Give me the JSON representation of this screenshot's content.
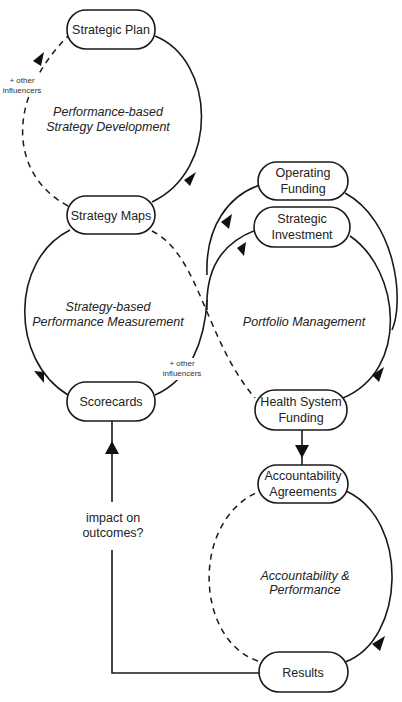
{
  "nodes": {
    "strategic_plan": [
      "Strategic Plan"
    ],
    "strategy_maps": [
      "Strategy Maps"
    ],
    "scorecards": [
      "Scorecards"
    ],
    "operating_funding": [
      "Operating",
      "Funding"
    ],
    "strategic_investment": [
      "Strategic",
      "Investment"
    ],
    "health_system_funding": [
      "Health System",
      "Funding"
    ],
    "accountability_agreements": [
      "Accountability",
      "Agreements"
    ],
    "results": [
      "Results"
    ]
  },
  "cycles": {
    "strategy_development": [
      "Performance-based",
      "Strategy Development"
    ],
    "performance_measurement": [
      "Strategy-based",
      "Performance Measurement"
    ],
    "portfolio_management": [
      "Portfolio Management"
    ],
    "accountability_performance": [
      "Accountability &",
      "Performance"
    ]
  },
  "annotations": {
    "other_influencers_top": [
      "+ other",
      "influencers"
    ],
    "other_influencers_mid": [
      "+ other",
      "influencers"
    ],
    "impact_on_outcomes": [
      "impact on",
      "outcomes?"
    ]
  }
}
